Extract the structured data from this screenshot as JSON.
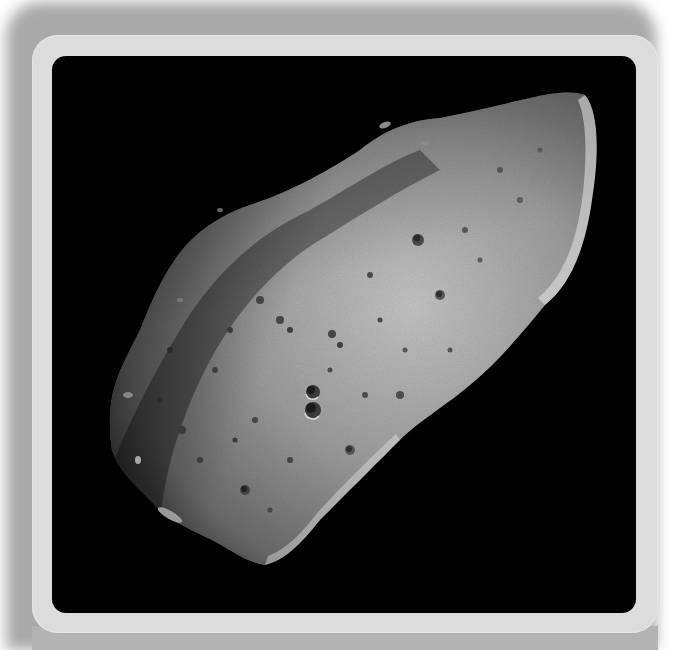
{
  "image": {
    "subject": "asteroid",
    "alt": "Grayscale photograph of a cratered, elongated asteroid against black space",
    "frame_color": "#dcdcdc",
    "shadow_color": "#a9a9a9",
    "background_color": "#000000",
    "surface_color": "#9a9a9a"
  }
}
